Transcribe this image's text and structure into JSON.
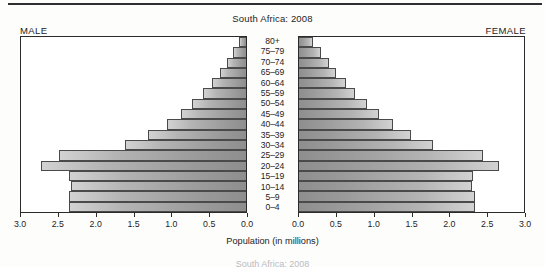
{
  "chart_title": "South Africa: 2008",
  "male_label": "MALE",
  "female_label": "FEMALE",
  "axis_title": "Population (in millions)",
  "footer_ghost": "South Africa: 2008",
  "colors": {
    "frame": "#2b2b2b",
    "bar_light": "#d2d2d2",
    "bar_dark": "#8e8e8e",
    "bar_border": "#4a4a4a",
    "text": "#1e1e1e",
    "top_rule": "#2e2e30"
  },
  "chart_data": {
    "type": "bar",
    "subtype": "population-pyramid",
    "title": "South Africa: 2008",
    "xlabel": "Population (in millions)",
    "ylabel": "",
    "grid": false,
    "legend": false,
    "xlim_left": [
      3.0,
      0.0
    ],
    "xlim_right": [
      0.0,
      3.0
    ],
    "xticks": [
      "3.0",
      "2.5",
      "2.0",
      "1.5",
      "1.0",
      "0.5",
      "0.0"
    ],
    "xticks_right": [
      "0.0",
      "0.5",
      "1.0",
      "1.5",
      "2.0",
      "2.5",
      "3.0"
    ],
    "categories": [
      "80+",
      "75-79",
      "70-74",
      "65-69",
      "60-64",
      "55-59",
      "50-54",
      "45-49",
      "40-44",
      "35-39",
      "30-34",
      "25-29",
      "20-24",
      "15-19",
      "10-14",
      "5-9",
      "0-4"
    ],
    "series": [
      {
        "name": "MALE",
        "side": "left",
        "values": [
          0.09,
          0.17,
          0.25,
          0.35,
          0.45,
          0.57,
          0.72,
          0.87,
          1.06,
          1.31,
          1.62,
          2.5,
          2.73,
          2.36,
          2.33,
          2.36,
          2.36
        ]
      },
      {
        "name": "FEMALE",
        "side": "right",
        "values": [
          0.19,
          0.29,
          0.4,
          0.5,
          0.62,
          0.75,
          0.91,
          1.07,
          1.25,
          1.49,
          1.79,
          2.45,
          2.67,
          2.32,
          2.3,
          2.35,
          2.35
        ]
      }
    ]
  }
}
